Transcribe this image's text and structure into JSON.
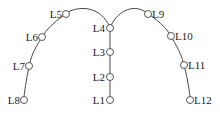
{
  "diagram": {
    "nodes": [
      {
        "id": "L1",
        "label": "L1",
        "x": 110,
        "y": 100,
        "label_side": "left"
      },
      {
        "id": "L2",
        "label": "L2",
        "x": 110,
        "y": 77,
        "label_side": "left"
      },
      {
        "id": "L3",
        "label": "L3",
        "x": 110,
        "y": 52,
        "label_side": "left"
      },
      {
        "id": "L4",
        "label": "L4",
        "x": 110,
        "y": 28,
        "label_side": "left"
      },
      {
        "id": "L5",
        "label": "L5",
        "x": 66,
        "y": 14,
        "label_side": "left"
      },
      {
        "id": "L6",
        "label": "L6",
        "x": 42,
        "y": 37,
        "label_side": "left"
      },
      {
        "id": "L7",
        "label": "L7",
        "x": 29,
        "y": 66,
        "label_side": "left"
      },
      {
        "id": "L8",
        "label": "L8",
        "x": 24,
        "y": 100,
        "label_side": "left"
      },
      {
        "id": "L9",
        "label": "L9",
        "x": 148,
        "y": 14,
        "label_side": "right"
      },
      {
        "id": "L10",
        "label": "L10",
        "x": 171,
        "y": 36,
        "label_side": "right"
      },
      {
        "id": "L11",
        "label": "L11",
        "x": 184,
        "y": 65,
        "label_side": "right"
      },
      {
        "id": "L12",
        "label": "L12",
        "x": 190,
        "y": 100,
        "label_side": "right"
      }
    ],
    "edges": [
      [
        "L1",
        "L2"
      ],
      [
        "L2",
        "L3"
      ],
      [
        "L3",
        "L4"
      ],
      [
        "L4",
        "L5"
      ],
      [
        "L5",
        "L6"
      ],
      [
        "L6",
        "L7"
      ],
      [
        "L7",
        "L8"
      ],
      [
        "L4",
        "L9"
      ],
      [
        "L9",
        "L10"
      ],
      [
        "L10",
        "L11"
      ],
      [
        "L11",
        "L12"
      ]
    ]
  }
}
